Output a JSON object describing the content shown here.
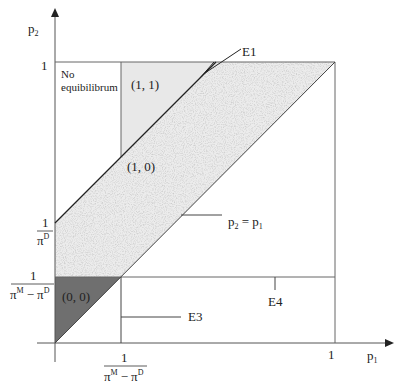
{
  "diagram": {
    "axes": {
      "y_label": "p",
      "y_label_sub": "2",
      "x_label": "p",
      "x_label_sub": "1",
      "y_tick_top": "1",
      "x_tick_right": "1",
      "y_tick_1_over_piD_num": "1",
      "y_tick_1_over_piD_den": "π",
      "y_tick_1_over_piD_den_sup": "D",
      "y_tick_1_over_diff_num": "1",
      "y_tick_1_over_diff_den_a": "π",
      "y_tick_1_over_diff_den_a_sup": "M",
      "y_tick_1_over_diff_den_minus": "−",
      "y_tick_1_over_diff_den_b": "π",
      "y_tick_1_over_diff_den_b_sup": "D",
      "x_tick_1_over_diff_num": "1",
      "x_tick_1_over_diff_den_a": "π",
      "x_tick_1_over_diff_den_a_sup": "M",
      "x_tick_1_over_diff_den_minus": "−",
      "x_tick_1_over_diff_den_b": "π",
      "x_tick_1_over_diff_den_b_sup": "D"
    },
    "regions": {
      "no_equilibrium_line1": "No",
      "no_equilibrium_line2": "equibilibrum",
      "r11": "(1, 1)",
      "r10": "(1, 0)",
      "r00": "(0, 0)"
    },
    "annotations": {
      "e1": "E1",
      "e3": "E3",
      "e4": "E4",
      "diag_p2": "p",
      "diag_p2_sub": "2",
      "diag_eq": " = ",
      "diag_p1": "p",
      "diag_p1_sub": "1"
    },
    "colors": {
      "dark_region": "#6f6f6f",
      "light_region": "#e9e9e9",
      "stipple_region": "#ececec",
      "line": "#333333"
    }
  }
}
